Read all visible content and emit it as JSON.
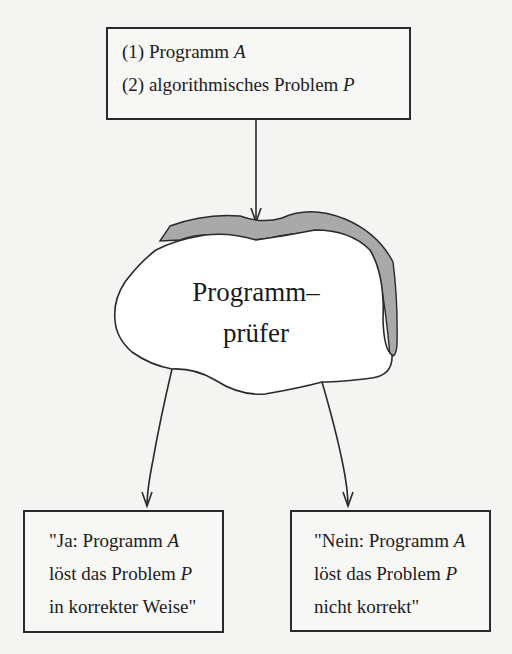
{
  "diagram": {
    "input_box": {
      "line1_prefix": "(1) Programm ",
      "line1_var": "A",
      "line2_prefix": "(2) algorithmisches Problem ",
      "line2_var": "P"
    },
    "checker": {
      "label_line1": "Programm–",
      "label_line2": "prüfer",
      "fill_color": "#ffffff",
      "shadow_color": "#a8a8a8"
    },
    "yes_box": {
      "line1_prefix": "\"Ja: Programm ",
      "line1_var": "A",
      "line2_prefix": "löst das Problem ",
      "line2_var": "P",
      "line3": "in korrekter Weise\""
    },
    "no_box": {
      "line1_prefix": "\"Nein: Programm ",
      "line1_var": "A",
      "line2_prefix": "löst das Problem ",
      "line2_var": "P",
      "line3": "nicht korrekt\""
    },
    "edges": [
      {
        "from": "input_box",
        "to": "checker"
      },
      {
        "from": "checker",
        "to": "yes_box"
      },
      {
        "from": "checker",
        "to": "no_box"
      }
    ]
  }
}
